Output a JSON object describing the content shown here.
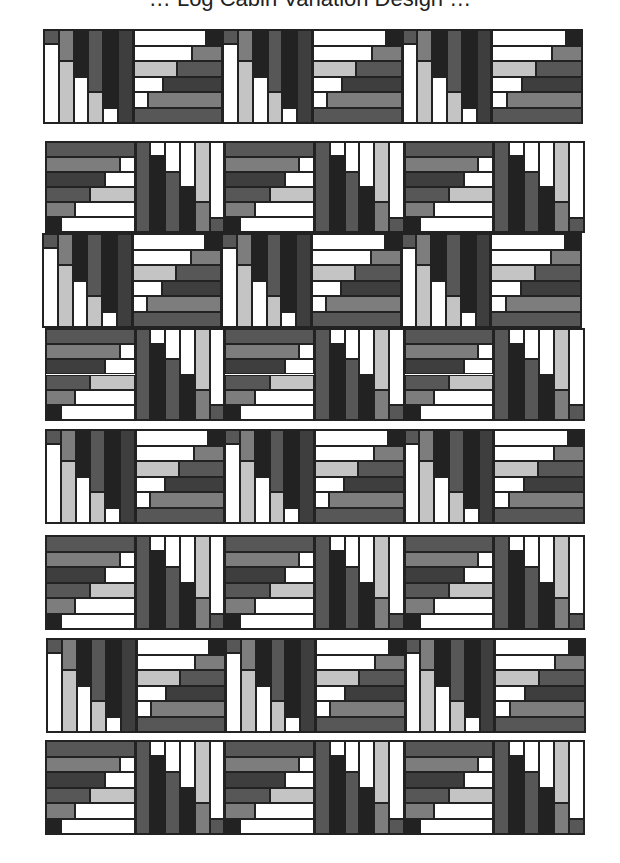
{
  "title_cut": "… Log Cabin Variation Design …",
  "colors": {
    "white": "#ffffff",
    "light": "#c4c4c4",
    "mid": "#7d7d7d",
    "dark": "#575757",
    "darker": "#3e3e3e",
    "black": "#222222",
    "border": "#222222"
  },
  "rows": [
    {
      "y": 29,
      "x": 43,
      "h": 95,
      "pattern": [
        "V",
        "H",
        "V",
        "H",
        "V",
        "H"
      ]
    },
    {
      "y": 141,
      "x": 45,
      "h": 92,
      "pattern": [
        "H2",
        "V2",
        "H2",
        "V2",
        "H2",
        "V2"
      ]
    },
    {
      "y": 233,
      "x": 42,
      "h": 95,
      "pattern": [
        "V",
        "H",
        "V",
        "H",
        "V",
        "H"
      ]
    },
    {
      "y": 328,
      "x": 45,
      "h": 93,
      "pattern": [
        "H2",
        "V2",
        "H2",
        "V2",
        "H2",
        "V2"
      ]
    },
    {
      "y": 429,
      "x": 45,
      "h": 95,
      "pattern": [
        "V",
        "H",
        "V",
        "H",
        "V",
        "H"
      ]
    },
    {
      "y": 535,
      "x": 45,
      "h": 95,
      "pattern": [
        "H2",
        "V2",
        "H2",
        "V2",
        "H2",
        "V2"
      ]
    },
    {
      "y": 638,
      "x": 46,
      "h": 95,
      "pattern": [
        "V",
        "H",
        "V",
        "H",
        "V",
        "H"
      ]
    },
    {
      "y": 740,
      "x": 45,
      "h": 95,
      "pattern": [
        "H2",
        "V2",
        "H2",
        "V2",
        "H2",
        "V2"
      ]
    }
  ],
  "row_width": 540,
  "block_templates": {
    "V": {
      "orientation": "vertical",
      "columns": [
        {
          "top": "dark",
          "bottom": "white",
          "split": 0.15
        },
        {
          "top": "mid",
          "bottom": "light",
          "split": 0.33
        },
        {
          "top": "black",
          "bottom": "white",
          "split": 0.5
        },
        {
          "top": "dark",
          "bottom": "light",
          "split": 0.67
        },
        {
          "top": "black",
          "bottom": "white",
          "split": 0.84
        },
        {
          "top": "darker",
          "bottom": "darker",
          "split": 1.0
        }
      ]
    },
    "H": {
      "orientation": "horizontal",
      "rows": [
        {
          "left": "white",
          "right": "black",
          "split": 0.82
        },
        {
          "left": "white",
          "right": "mid",
          "split": 0.66
        },
        {
          "left": "light",
          "right": "dark",
          "split": 0.49
        },
        {
          "left": "white",
          "right": "darker",
          "split": 0.33
        },
        {
          "left": "white",
          "right": "mid",
          "split": 0.16
        },
        {
          "left": "dark",
          "right": "dark",
          "split": 1.0
        }
      ]
    },
    "H2": {
      "orientation": "horizontal",
      "rows": [
        {
          "left": "dark",
          "right": "dark",
          "split": 1.0
        },
        {
          "left": "mid",
          "right": "white",
          "split": 0.83
        },
        {
          "left": "darker",
          "right": "white",
          "split": 0.67
        },
        {
          "left": "dark",
          "right": "light",
          "split": 0.5
        },
        {
          "left": "mid",
          "right": "white",
          "split": 0.33
        },
        {
          "left": "black",
          "right": "white",
          "split": 0.17
        }
      ]
    },
    "V2": {
      "orientation": "vertical",
      "columns": [
        {
          "top": "dark",
          "bottom": "dark",
          "split": 1.0
        },
        {
          "top": "white",
          "bottom": "black",
          "split": 0.16
        },
        {
          "top": "white",
          "bottom": "dark",
          "split": 0.33
        },
        {
          "top": "white",
          "bottom": "black",
          "split": 0.5
        },
        {
          "top": "light",
          "bottom": "mid",
          "split": 0.67
        },
        {
          "top": "white",
          "bottom": "dark",
          "split": 0.84
        }
      ]
    }
  }
}
